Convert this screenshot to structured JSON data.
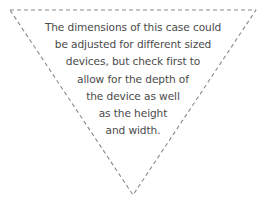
{
  "shape": {
    "type": "inverted-triangle",
    "stroke_color": "#8a8a8a",
    "stroke_style": "dashed",
    "points": {
      "top_left": [
        10,
        10
      ],
      "top_right": [
        256,
        10
      ],
      "apex": [
        133,
        195
      ]
    }
  },
  "note": {
    "text_color": "#4a4a4a",
    "lines": [
      "The dimensions of this case could",
      "be adjusted for different sized",
      "devices, but check first to",
      "allow for the depth of",
      "the device as well",
      "as the height",
      "and width."
    ]
  }
}
